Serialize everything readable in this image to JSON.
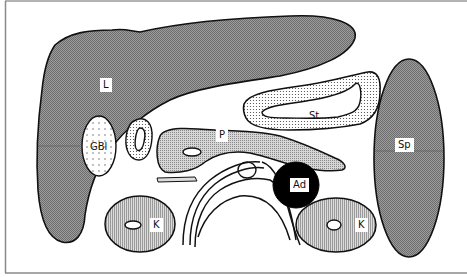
{
  "diagram": {
    "type": "anatomical-cross-section-schematic",
    "colors": {
      "background": "#ffffff",
      "outline": "#111111",
      "solid_organ_fill": "#8a8a8a",
      "pancreas_fill": "#b5b5b5",
      "kidney_fill": "#c4c4c4",
      "stippled_fill": "#f2f2f2",
      "adrenal_fill": "#000000",
      "frame": "#9a9a9a"
    },
    "labels": {
      "liver": "L",
      "gallbladder": "GBl",
      "stomach": "St",
      "pancreas": "P",
      "spleen": "Sp",
      "adrenal": "Ad",
      "kidney_right": "K",
      "kidney_left": "K"
    }
  }
}
